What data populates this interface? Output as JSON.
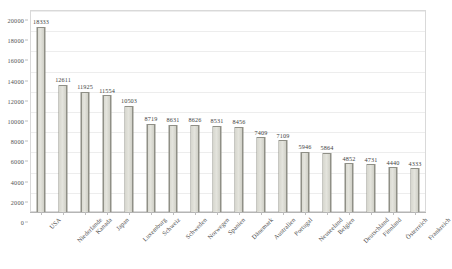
{
  "chart_data": {
    "type": "bar",
    "title": "",
    "xlabel": "",
    "ylabel": "",
    "ylim": [
      0,
      20000
    ],
    "ytick_step": 2000,
    "grid": true,
    "legend": "none",
    "label_rotation_deg": -45,
    "categories": [
      "USA",
      "Niederlande",
      "Kanada",
      "Japan",
      "Luxemburg",
      "Schweiz",
      "Schweden",
      "Norwegen",
      "Spanien",
      "Dänemark",
      "Australien",
      "Portugal",
      "Neuseeland",
      "Belgien",
      "Deutschland",
      "Finnland",
      "Österreich",
      "Frankreich"
    ],
    "values": [
      18333,
      12611,
      11925,
      11554,
      10503,
      8719,
      8631,
      8626,
      8531,
      8456,
      7409,
      7109,
      5946,
      5864,
      4852,
      4731,
      4440,
      4333
    ],
    "value_labels": [
      "18333",
      "12611",
      "11925",
      "11554",
      "10503",
      "8719",
      "8631",
      "8626",
      "8531",
      "8456",
      "7409",
      "7109",
      "5946",
      "5864",
      "4852",
      "4731",
      "4440",
      "4333"
    ],
    "ytick_labels": [
      "0",
      "2000",
      "4000",
      "6000",
      "8000",
      "10000",
      "12000",
      "14000",
      "16000",
      "18000",
      "20000"
    ],
    "colors": {
      "bar_fill": "#e0e0d8",
      "bar_edge": "#8f8f86",
      "gridline": "#ededed",
      "axis": "#b5b5b5",
      "text": "#4a4a4a",
      "background": "#ffffff"
    }
  }
}
